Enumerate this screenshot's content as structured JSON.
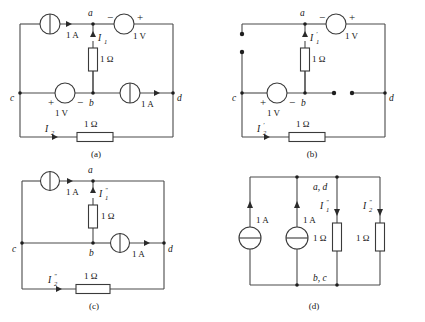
{
  "figure": {
    "panels": [
      {
        "id": "a",
        "caption": "(a)",
        "nodes": {
          "a": "a",
          "b": "b",
          "c": "c",
          "d": "d"
        },
        "labels": {
          "top_current_source": "1 A",
          "top_voltage_source": "1 V",
          "top_voltage_minus": "−",
          "top_voltage_plus": "+",
          "vertical_resistor": "1 Ω",
          "vertical_current": "I",
          "vertical_current_sub": "1",
          "mid_voltage_source": "1 V",
          "mid_voltage_plus": "+",
          "mid_voltage_minus": "−",
          "mid_current_source": "1 A",
          "bottom_current": "I",
          "bottom_current_sub": "2",
          "bottom_resistor": "1 Ω"
        }
      },
      {
        "id": "b",
        "caption": "(b)",
        "nodes": {
          "a": "a",
          "b": "b",
          "c": "c",
          "d": "d"
        },
        "labels": {
          "top_voltage_source": "1 V",
          "top_voltage_minus": "−",
          "top_voltage_plus": "+",
          "vertical_resistor": "1 Ω",
          "vertical_current": "I",
          "vertical_current_sub": "1",
          "vertical_current_prime": "′",
          "mid_voltage_source": "1 V",
          "mid_voltage_plus": "+",
          "mid_voltage_minus": "−",
          "bottom_current": "I",
          "bottom_current_sub": "2",
          "bottom_current_prime": "′",
          "bottom_resistor": "1 Ω"
        }
      },
      {
        "id": "c",
        "caption": "(c)",
        "nodes": {
          "a": "a",
          "b": "b",
          "c": "c",
          "d": "d"
        },
        "labels": {
          "top_current_source": "1 A",
          "vertical_resistor": "1 Ω",
          "vertical_current": "I",
          "vertical_current_sub": "1",
          "vertical_current_prime": "″",
          "mid_current_source": "1 A",
          "bottom_current": "I",
          "bottom_current_sub": "2",
          "bottom_current_prime": "″",
          "bottom_resistor": "1 Ω"
        }
      },
      {
        "id": "d",
        "caption": "(d)",
        "nodes": {
          "top": "a, d",
          "bottom": "b, c"
        },
        "labels": {
          "source1": "1 A",
          "source2": "1 A",
          "resistor1": "1 Ω",
          "resistor2": "1 Ω",
          "current1": "I",
          "current1_sub": "1",
          "current1_prime": "″",
          "current2": "I",
          "current2_sub": "2",
          "current2_prime": "″"
        }
      }
    ]
  },
  "colors": {
    "wire": "#4a4a4a",
    "component": "#3a3a3a",
    "node": "#1e1e1e",
    "text": "#151515",
    "background": "#ffffff"
  }
}
